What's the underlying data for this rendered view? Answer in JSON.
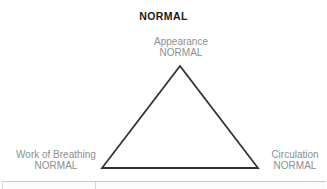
{
  "diagram": {
    "title": "NORMAL",
    "type": "assessment-triangle",
    "nodes": {
      "appearance": {
        "line1": "Appearance",
        "line2": "NORMAL"
      },
      "work_of_breathing": {
        "line1": "Work of Breathing",
        "line2": "NORMAL"
      },
      "circulation": {
        "line1": "Circulation",
        "line2": "NORMAL"
      }
    },
    "colors": {
      "title_text": "#1a1a1a",
      "label_text": "#8e8e8e",
      "triangle_stroke": "#333333",
      "table_border": "#c9c9c9",
      "background": "#ffffff"
    }
  }
}
